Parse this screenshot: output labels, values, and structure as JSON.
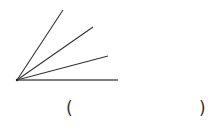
{
  "diagram": {
    "type": "angle-figure",
    "vertex": {
      "x": 17,
      "y": 80
    },
    "rays": [
      {
        "id": "ray-1",
        "end": {
          "x": 63,
          "y": 10
        }
      },
      {
        "id": "ray-2",
        "end": {
          "x": 93,
          "y": 27
        }
      },
      {
        "id": "ray-3",
        "end": {
          "x": 108,
          "y": 56
        }
      },
      {
        "id": "ray-4",
        "end": {
          "x": 118,
          "y": 80
        }
      }
    ],
    "stroke_color": "#333333"
  },
  "answer": {
    "open_paren": "(",
    "close_paren": ")",
    "value": ""
  }
}
